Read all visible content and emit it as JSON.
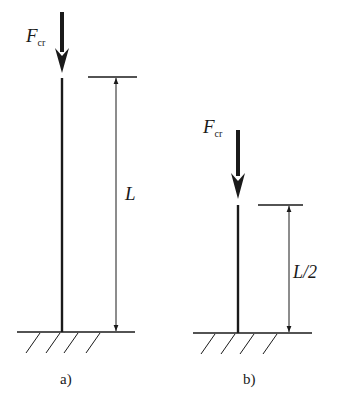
{
  "diagram": {
    "panels": [
      {
        "id": "a",
        "caption": "a)",
        "force_label": "F",
        "force_subscript": "cr",
        "length_label": "L"
      },
      {
        "id": "b",
        "caption": "b)",
        "force_label": "F",
        "force_subscript": "cr",
        "length_label": "L/2"
      }
    ],
    "colors": {
      "stroke": "#1a1a1a",
      "background": "#ffffff"
    }
  }
}
